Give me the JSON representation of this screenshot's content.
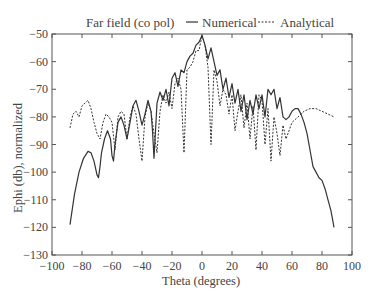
{
  "chart_data": {
    "type": "line",
    "title": "Far field (co pol)",
    "xlabel": "Theta (degrees)",
    "ylabel": "Ephi (db), normalized",
    "xlim": [
      -100,
      100
    ],
    "ylim": [
      -130,
      -50
    ],
    "xticks": [
      -100,
      -80,
      -60,
      -40,
      -20,
      0,
      20,
      40,
      60,
      80,
      100
    ],
    "yticks": [
      -50,
      -60,
      -70,
      -80,
      -90,
      -100,
      -110,
      -120,
      -130
    ],
    "grid": false,
    "legend_position": "top",
    "legend": [
      {
        "name": "Numerical",
        "style": "solid"
      },
      {
        "name": "Analytical",
        "style": "dashed"
      }
    ],
    "series": [
      {
        "name": "Numerical",
        "style": "solid",
        "x": [
          -88,
          -85,
          -82,
          -79,
          -76,
          -74,
          -72,
          -70,
          -69,
          -68,
          -67,
          -65,
          -63,
          -61,
          -60,
          -59,
          -58,
          -56,
          -54,
          -52,
          -50,
          -48,
          -46,
          -44,
          -42,
          -40,
          -38,
          -36,
          -34,
          -33,
          -32,
          -31,
          -30,
          -28,
          -26,
          -24,
          -22,
          -20,
          -18,
          -16,
          -14,
          -12,
          -10,
          -8,
          -6,
          -4,
          -2,
          0,
          2,
          4,
          6,
          8,
          10,
          12,
          14,
          16,
          18,
          20,
          22,
          24,
          26,
          28,
          30,
          32,
          34,
          36,
          38,
          40,
          42,
          44,
          46,
          48,
          50,
          52,
          54,
          56,
          58,
          60,
          62,
          64,
          66,
          68,
          70,
          72,
          74,
          76,
          78,
          80,
          82,
          84,
          86,
          88
        ],
        "y": [
          -119,
          -108,
          -100,
          -95,
          -92.5,
          -93,
          -96,
          -101,
          -102,
          -98,
          -93,
          -88,
          -85,
          -88,
          -94,
          -96,
          -90,
          -82,
          -80,
          -83,
          -88,
          -82,
          -76,
          -74,
          -78,
          -83,
          -79,
          -74,
          -78,
          -85,
          -95,
          -85,
          -75,
          -71,
          -74,
          -70,
          -76,
          -66,
          -64,
          -69,
          -63,
          -64,
          -60,
          -58,
          -57,
          -54,
          -53,
          -50.5,
          -54,
          -59,
          -55,
          -60,
          -65,
          -63,
          -70,
          -66,
          -73,
          -68,
          -75,
          -70,
          -78,
          -72,
          -81,
          -74,
          -79,
          -72,
          -77,
          -72,
          -80,
          -70,
          -72,
          -70,
          -77,
          -73,
          -80,
          -81,
          -80,
          -78,
          -77,
          -77,
          -79,
          -82,
          -86,
          -92,
          -98,
          -100,
          -102,
          -103,
          -106,
          -110,
          -114,
          -120
        ]
      },
      {
        "name": "Analytical",
        "style": "dashed",
        "x": [
          -88,
          -86,
          -84,
          -82,
          -80,
          -78,
          -76,
          -74,
          -72,
          -70,
          -68,
          -66,
          -64,
          -62,
          -60,
          -58,
          -56,
          -54,
          -52,
          -50,
          -48,
          -46,
          -44,
          -42,
          -40,
          -38,
          -36,
          -34,
          -32,
          -30,
          -28,
          -26,
          -24,
          -22,
          -20,
          -18,
          -16,
          -14,
          -12,
          -10,
          -8,
          -6,
          -4,
          -2,
          0,
          2,
          4,
          6,
          8,
          10,
          12,
          14,
          16,
          18,
          20,
          22,
          24,
          26,
          28,
          30,
          32,
          34,
          36,
          38,
          40,
          42,
          44,
          46,
          48,
          50,
          52,
          54,
          56,
          60,
          64,
          68,
          72,
          76,
          80,
          84,
          88
        ],
        "y": [
          -84,
          -79,
          -78,
          -80,
          -76,
          -75,
          -74,
          -77,
          -82,
          -86,
          -88,
          -82,
          -79,
          -80,
          -82,
          -92,
          -80,
          -78,
          -79,
          -88,
          -80,
          -76,
          -79,
          -88,
          -96,
          -80,
          -75,
          -78,
          -86,
          -93,
          -78,
          -72,
          -75,
          -71,
          -77,
          -68,
          -66,
          -70,
          -93,
          -63,
          -62,
          -60,
          -56,
          -56,
          -50.5,
          -54,
          -62,
          -90,
          -63,
          -67,
          -76,
          -70,
          -72,
          -79,
          -72,
          -85,
          -78,
          -72,
          -84,
          -75,
          -88,
          -76,
          -92,
          -72,
          -74,
          -90,
          -77,
          -96,
          -80,
          -86,
          -94,
          -83,
          -88,
          -82,
          -80,
          -78,
          -77,
          -77,
          -78,
          -79,
          -80
        ]
      }
    ]
  }
}
